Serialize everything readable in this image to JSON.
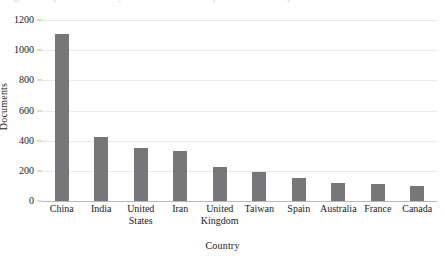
{
  "caption": {
    "text": "Figure 3. Top ten countries by number of documents published on the topic"
  },
  "colors": {
    "bar_fill": "#77777a",
    "gridline": "#e8e8e8",
    "axis": "#b9b9b9",
    "background": "#ffffff",
    "text": "#1a1a1a"
  },
  "chart_data": {
    "type": "bar",
    "title": "",
    "xlabel": "Country",
    "ylabel": "Documents",
    "categories": [
      "China",
      "India",
      "United States",
      "Iran",
      "United Kingdom",
      "Taiwan",
      "Spain",
      "Australia",
      "France",
      "Canada"
    ],
    "category_lines": [
      [
        "China"
      ],
      [
        "India"
      ],
      [
        "United",
        "States"
      ],
      [
        "Iran"
      ],
      [
        "United",
        "Kingdom"
      ],
      [
        "Taiwan"
      ],
      [
        "Spain"
      ],
      [
        "Australia"
      ],
      [
        "France"
      ],
      [
        "Canada"
      ]
    ],
    "values": [
      1110,
      425,
      350,
      330,
      225,
      190,
      150,
      118,
      113,
      100
    ],
    "ylim": [
      0,
      1200
    ],
    "yticks": [
      0,
      200,
      400,
      600,
      800,
      1000,
      1200
    ],
    "ytick_labels": [
      "0",
      "200",
      "400",
      "600",
      "800",
      "1000",
      "1200"
    ],
    "grid": true,
    "legend": false
  }
}
